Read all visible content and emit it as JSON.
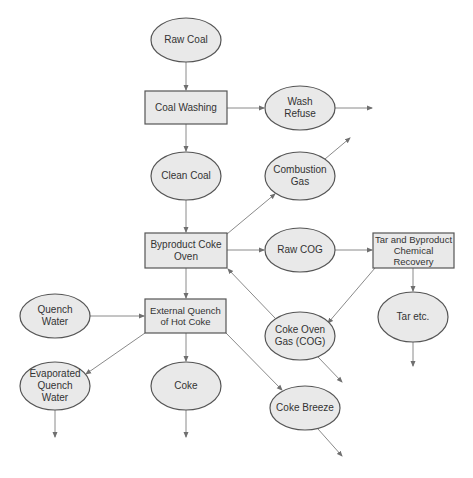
{
  "diagram": {
    "type": "process-flow",
    "nodes": {
      "raw_coal": {
        "label": "Raw Coal",
        "shape": "ellipse"
      },
      "coal_washing": {
        "label": "Coal Washing",
        "shape": "box"
      },
      "wash_refuse": {
        "label": "Wash Refuse",
        "shape": "ellipse"
      },
      "clean_coal": {
        "label": "Clean Coal",
        "shape": "ellipse"
      },
      "combustion_gas": {
        "label": "Combustion Gas",
        "shape": "ellipse"
      },
      "byproduct_coke_oven": {
        "label": "Byproduct Coke Oven",
        "shape": "box"
      },
      "raw_cog": {
        "label": "Raw COG",
        "shape": "ellipse"
      },
      "tar_recovery": {
        "label": "Tar and Byproduct Chemical Recovery",
        "shape": "box"
      },
      "tar_etc": {
        "label": "Tar etc.",
        "shape": "ellipse"
      },
      "coke_oven_gas": {
        "label": "Coke Oven Gas (COG)",
        "shape": "ellipse"
      },
      "quench_water": {
        "label": "Quench Water",
        "shape": "ellipse"
      },
      "external_quench": {
        "label": "External Quench of Hot Coke",
        "shape": "box"
      },
      "evaporated_quench_water": {
        "label": "Evaporated Quench Water",
        "shape": "ellipse"
      },
      "coke": {
        "label": "Coke",
        "shape": "ellipse"
      },
      "coke_breeze": {
        "label": "Coke Breeze",
        "shape": "ellipse"
      }
    },
    "edges": [
      {
        "from": "Raw Coal",
        "to": "Coal Washing"
      },
      {
        "from": "Coal Washing",
        "to": "Wash Refuse"
      },
      {
        "from": "Wash Refuse",
        "to": "(out)"
      },
      {
        "from": "Coal Washing",
        "to": "Clean Coal"
      },
      {
        "from": "Clean Coal",
        "to": "Byproduct Coke Oven"
      },
      {
        "from": "Byproduct Coke Oven",
        "to": "Combustion Gas"
      },
      {
        "from": "Combustion Gas",
        "to": "(out)"
      },
      {
        "from": "Byproduct Coke Oven",
        "to": "Raw COG"
      },
      {
        "from": "Raw COG",
        "to": "Tar and Byproduct Chemical Recovery"
      },
      {
        "from": "Tar and Byproduct Chemical Recovery",
        "to": "Tar etc."
      },
      {
        "from": "Tar etc.",
        "to": "(out)"
      },
      {
        "from": "Tar and Byproduct Chemical Recovery",
        "to": "Coke Oven Gas (COG)"
      },
      {
        "from": "Coke Oven Gas (COG)",
        "to": "Byproduct Coke Oven"
      },
      {
        "from": "Coke Oven Gas (COG)",
        "to": "(out)"
      },
      {
        "from": "Byproduct Coke Oven",
        "to": "External Quench of Hot Coke"
      },
      {
        "from": "Quench Water",
        "to": "External Quench of Hot Coke"
      },
      {
        "from": "External Quench of Hot Coke",
        "to": "Evaporated Quench Water"
      },
      {
        "from": "External Quench of Hot Coke",
        "to": "Coke"
      },
      {
        "from": "External Quench of Hot Coke",
        "to": "Coke Breeze"
      },
      {
        "from": "Evaporated Quench Water",
        "to": "(out)"
      },
      {
        "from": "Coke",
        "to": "(out)"
      },
      {
        "from": "Coke Breeze",
        "to": "(out)"
      }
    ],
    "colors": {
      "node_fill": "#e9e9e9",
      "node_stroke": "#555555",
      "edge": "#8a8a8a",
      "text": "#333333"
    }
  }
}
